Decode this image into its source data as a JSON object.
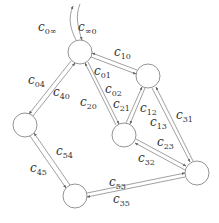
{
  "diagram": {
    "type": "directed-graph",
    "nodes": [
      {
        "id": "0",
        "x": 80,
        "y": 52,
        "r": 12
      },
      {
        "id": "1",
        "x": 148,
        "y": 76,
        "r": 12
      },
      {
        "id": "2",
        "x": 124,
        "y": 135,
        "r": 12
      },
      {
        "id": "3",
        "x": 197,
        "y": 173,
        "r": 12
      },
      {
        "id": "4",
        "x": 25,
        "y": 125,
        "r": 12
      },
      {
        "id": "5",
        "x": 75,
        "y": 196,
        "r": 12
      }
    ],
    "labels": {
      "c0inf": {
        "base": "c",
        "sub": "0∞"
      },
      "cinf0": {
        "base": "c",
        "sub": "∞0"
      },
      "c10": {
        "base": "c",
        "sub": "10"
      },
      "c01": {
        "base": "c",
        "sub": "01"
      },
      "c02": {
        "base": "c",
        "sub": "02"
      },
      "c04": {
        "base": "c",
        "sub": "04"
      },
      "c40": {
        "base": "c",
        "sub": "40"
      },
      "c20": {
        "base": "c",
        "sub": "20"
      },
      "c21": {
        "base": "c",
        "sub": "21"
      },
      "c12": {
        "base": "c",
        "sub": "12"
      },
      "c13": {
        "base": "c",
        "sub": "13"
      },
      "c31": {
        "base": "c",
        "sub": "31"
      },
      "c23": {
        "base": "c",
        "sub": "23"
      },
      "c32": {
        "base": "c",
        "sub": "32"
      },
      "c54": {
        "base": "c",
        "sub": "54"
      },
      "c45": {
        "base": "c",
        "sub": "45"
      },
      "c53": {
        "base": "c",
        "sub": "53"
      },
      "c35": {
        "base": "c",
        "sub": "35"
      }
    },
    "edges": [
      {
        "from": "0",
        "to": "inf",
        "label": "c0∞"
      },
      {
        "from": "inf",
        "to": "0",
        "label": "c∞0"
      },
      {
        "from": "1",
        "to": "0",
        "label": "c10"
      },
      {
        "from": "0",
        "to": "1",
        "label": "c01"
      },
      {
        "from": "0",
        "to": "2",
        "label": "c02"
      },
      {
        "from": "2",
        "to": "0",
        "label": "c20"
      },
      {
        "from": "0",
        "to": "4",
        "label": "c04"
      },
      {
        "from": "4",
        "to": "0",
        "label": "c40"
      },
      {
        "from": "2",
        "to": "1",
        "label": "c21"
      },
      {
        "from": "1",
        "to": "2",
        "label": "c12"
      },
      {
        "from": "1",
        "to": "3",
        "label": "c13"
      },
      {
        "from": "3",
        "to": "1",
        "label": "c31"
      },
      {
        "from": "2",
        "to": "3",
        "label": "c23"
      },
      {
        "from": "3",
        "to": "2",
        "label": "c32"
      },
      {
        "from": "5",
        "to": "4",
        "label": "c54"
      },
      {
        "from": "4",
        "to": "5",
        "label": "c45"
      },
      {
        "from": "5",
        "to": "3",
        "label": "c53"
      },
      {
        "from": "3",
        "to": "5",
        "label": "c35"
      }
    ]
  }
}
